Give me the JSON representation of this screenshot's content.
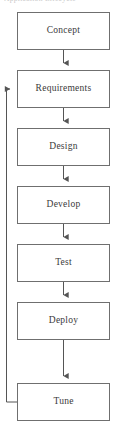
{
  "caption_remnant": "Application Lifecycle",
  "diagram": {
    "orientation": "vertical",
    "colors": {
      "box_border": "#6f6f6f",
      "box_fill": "#ffffff",
      "connector": "#555555",
      "label_text": "#3a3a3a",
      "page_background": "#ffffff"
    },
    "nodes": [
      {
        "id": "concept",
        "label": "Concept",
        "x": 17,
        "y": 12,
        "width": 93,
        "height": 38
      },
      {
        "id": "requirements",
        "label": "Requirements",
        "x": 17,
        "y": 70,
        "width": 93,
        "height": 38
      },
      {
        "id": "design",
        "label": "Design",
        "x": 17,
        "y": 128,
        "width": 93,
        "height": 38
      },
      {
        "id": "develop",
        "label": "Develop",
        "x": 17,
        "y": 186,
        "width": 93,
        "height": 38
      },
      {
        "id": "test",
        "label": "Test",
        "x": 17,
        "y": 244,
        "width": 93,
        "height": 38
      },
      {
        "id": "deploy",
        "label": "Deploy",
        "x": 17,
        "y": 302,
        "width": 93,
        "height": 38
      },
      {
        "id": "tune",
        "label": "Tune",
        "x": 17,
        "y": 383,
        "width": 93,
        "height": 38
      }
    ],
    "connectors": [
      {
        "id": "concept-to-requirements",
        "from": "concept",
        "to": "requirements",
        "type": "straight-down",
        "arrow": true
      },
      {
        "id": "requirements-to-design",
        "from": "requirements",
        "to": "design",
        "type": "straight-down",
        "arrow": true
      },
      {
        "id": "design-to-develop",
        "from": "design",
        "to": "develop",
        "type": "straight-down",
        "arrow": true
      },
      {
        "id": "develop-to-test",
        "from": "develop",
        "to": "test",
        "type": "straight-down",
        "arrow": true
      },
      {
        "id": "test-to-deploy",
        "from": "test",
        "to": "deploy",
        "type": "straight-down",
        "arrow": true
      },
      {
        "id": "deploy-to-tune",
        "from": "deploy",
        "to": "tune",
        "type": "straight-down",
        "arrow": true
      },
      {
        "id": "tune-to-requirements-feedback",
        "from": "tune",
        "to": "requirements",
        "type": "left-feedback-loop",
        "arrow": true
      }
    ]
  }
}
